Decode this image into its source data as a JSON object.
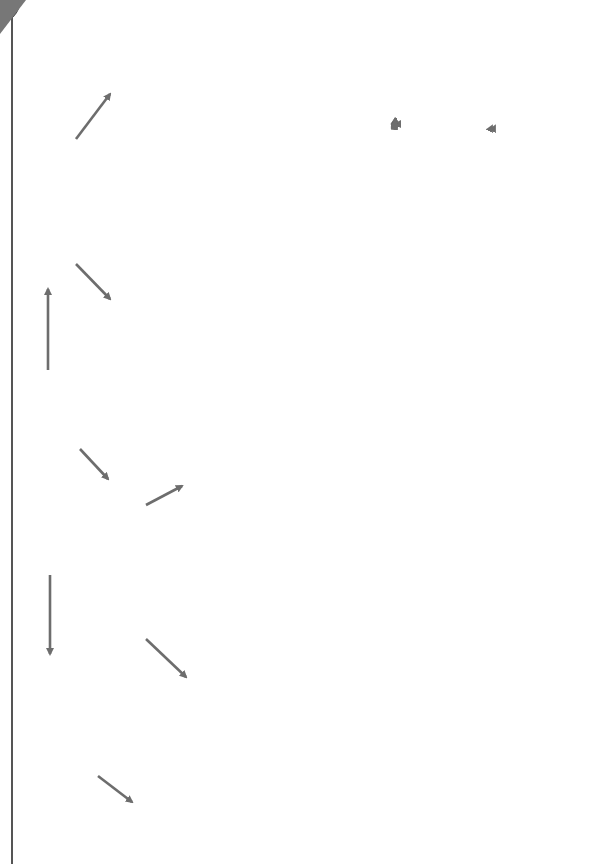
{
  "orientation": "rotated-90-ccw",
  "colors": {
    "box_background": "#e4e4e4",
    "ellipse_fill": "#9a9a9a",
    "arrow": "#6d6d6d",
    "text": "#333333",
    "title_text": "#1a1a1a"
  },
  "variables": {
    "center": {
      "line1": "MOTS",
      "line2": "VARIABLES"
    },
    "designent": {
      "text": "Ils désignent quelque chose ou quelqu’un."
    },
    "ajoutent": {
      "text": "Ils s’ajoutent au nom."
    },
    "noms": {
      "title": "noms",
      "bullet1": "• Ils nomment la chose ou la personne dont on parle.",
      "bullet2": "• Ils peuvent être précédés par un déterminant :",
      "examples": "(un) ami, (une) fleur, (des) enfants, (le) chocolat, (la) maison… + nom."
    },
    "pronoms": {
      "title": "pronoms",
      "bullet1": "• Ils désignent quelque chose ou quelqu’un sans le nommer (on ne peut le savoir que par le contexte).",
      "bullet2": "• Ils sont souvent suivis d’un verbe.",
      "examples": "je, tu, il(s), elle(s), on, nous, vous, me, te, se, le, la, les, celui-ci, qui…"
    },
    "adjectifs": {
      "title": "adjectifs",
      "line1": "Ils décrivent quelqu’un ou quelque chose.",
      "line2": "Ils peuvent se mettre au féminin et au masculin : ",
      "examples": "un pantalon blanc, une chemise blanche."
    },
    "determinants": {
      "title": "déterminants",
      "text": "Ils sont placés devant un nom, dont ils précisent souvent la quantité : ",
      "examples": "un, une, des, le, la, les, trois, cinq, cent, certains, mon, ma, ses, ces…"
    },
    "verbes": {
      "title": "verbes",
      "bullet1_a": "• Ils expriment une action (sauf le verbe ",
      "bullet1_it": "être",
      "bullet1_b": " et les verbes d’état).",
      "bullet2": "• Ils se conjuguent.",
      "examples": "je ris, tu ris, il rit"
    }
  },
  "invariables": {
    "center": {
      "line1": "MOTS",
      "line2": "INVARIABLES"
    },
    "prepositions": {
      "title": "prépositions",
      "bullet1": "• Elles introduisent des compléments de lieu, de temps, etc.",
      "examples1": "à, dans, par, pour, en, vers, avec, de, sans, sous…",
      "bullet2": "• Pour vous aider : dans préposition, il y a « position ».",
      "examples2": "Devant, derrière, à côté de, sur, sous, dans",
      "bullet2_end": " sont des prépositions."
    },
    "interjections": {
      "title": "interjections",
      "text": "Ce sont des exclamations : ",
      "examples": "eh ! oh ! allô ? aïe ! ouf ! boum !"
    },
    "adverbes": {
      "title": "adverbes",
      "intro": "Ils expriment en un seul mot :",
      "items": [
        {
          "label": "– la manière : ",
          "examples": "lentement, violemment, gentiment…"
        },
        {
          "label": "– le lieu : ",
          "examples": "ici, loin, dehors…"
        },
        {
          "label": "– le moment : ",
          "examples": "hier, maintenant, autrefois…"
        },
        {
          "label": "– le degré : ",
          "examples": "un peu, beaucoup, très, si…"
        },
        {
          "label": "– la négation (2 mots) : ",
          "examples": "ne pas, ne plus, ne jamais…"
        }
      ]
    },
    "coordination": {
      "title": "conjonctions de coordination",
      "examples": "mais, ou, et, donc, or, ni car"
    },
    "subordination": {
      "title": "conjonctions de subordination",
      "text": "Elles débutent une partie de phrase appelée proposition subordonnée : ",
      "examples": "que, quand, comme, si, lorsque, parce que, si bien que, afin que…"
    }
  }
}
